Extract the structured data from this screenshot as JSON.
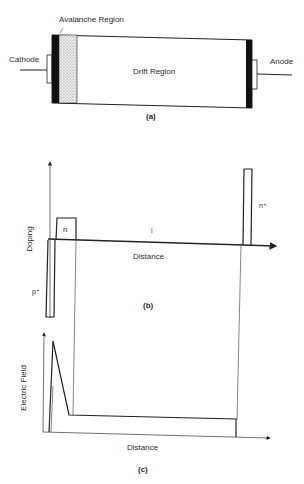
{
  "figure_a": {
    "labels": {
      "avalanche_region": "Avalanche Region",
      "cathode": "Cathode",
      "drift_region": "Drift Region",
      "anode": "Anode"
    },
    "caption": "(a)"
  },
  "figure_b": {
    "y_axis_label": "Doping",
    "x_axis_label": "Distance",
    "region_labels": {
      "n": "n",
      "i": "i",
      "n_plus": "n⁺",
      "p_plus": "p⁺"
    },
    "caption": "(b)"
  },
  "figure_c": {
    "y_axis_label": "Electric Field",
    "x_axis_label": "Distance",
    "caption": "(c)"
  },
  "colors": {
    "ink": "#222222",
    "contact": "#111111",
    "avalanche_fill": "#d8d8d8",
    "background": "#ffffff"
  }
}
